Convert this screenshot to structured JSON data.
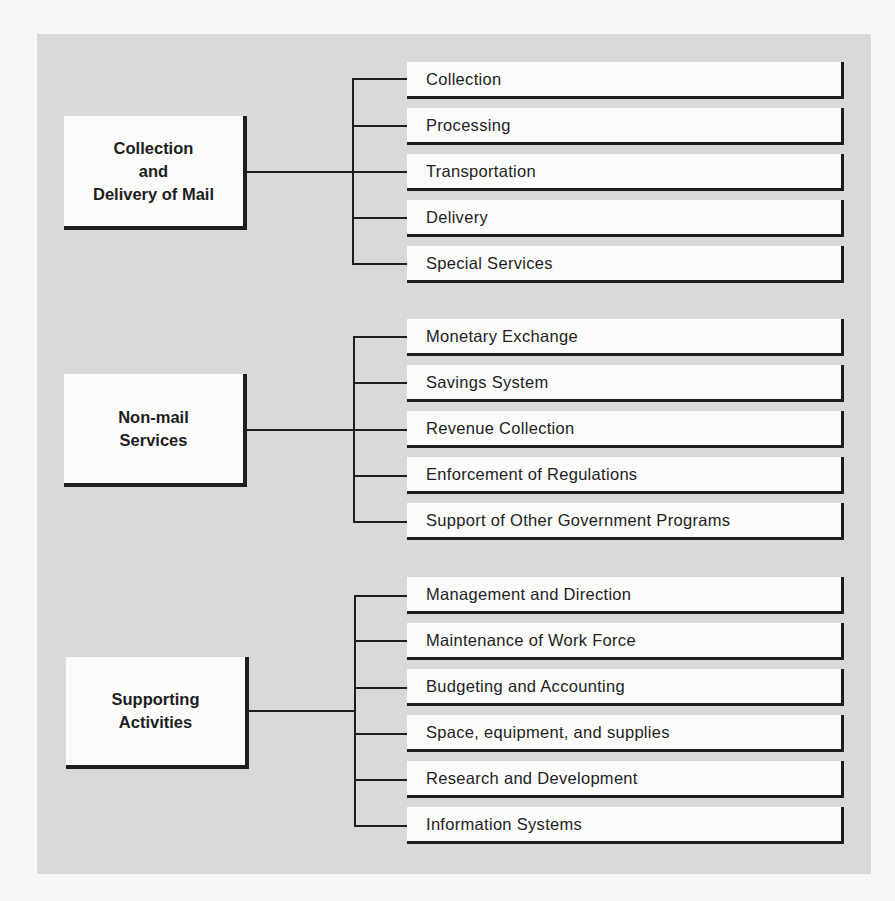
{
  "diagram": {
    "type": "hierarchy",
    "groups": [
      {
        "label": "Collection\nand\nDelivery of Mail",
        "children": [
          {
            "label": "Collection"
          },
          {
            "label": "Processing"
          },
          {
            "label": "Transportation"
          },
          {
            "label": "Delivery"
          },
          {
            "label": "Special Services"
          }
        ]
      },
      {
        "label": "Non-mail\nServices",
        "children": [
          {
            "label": "Monetary Exchange"
          },
          {
            "label": "Savings System"
          },
          {
            "label": "Revenue Collection"
          },
          {
            "label": "Enforcement of Regulations"
          },
          {
            "label": "Support of Other Government Programs"
          }
        ]
      },
      {
        "label": "Supporting\nActivities",
        "children": [
          {
            "label": "Management and Direction"
          },
          {
            "label": "Maintenance of Work Force"
          },
          {
            "label": "Budgeting and Accounting"
          },
          {
            "label": "Space, equipment, and supplies"
          },
          {
            "label": "Research and Development"
          },
          {
            "label": "Information Systems"
          }
        ]
      }
    ]
  }
}
